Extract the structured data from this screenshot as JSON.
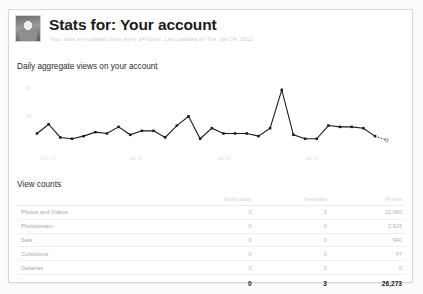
{
  "header": {
    "title": "Stats for: Your account",
    "subtitle": "Your stats are updated once every 24 hours. Last updated on Tue, Jan 24, 2012",
    "avatar_alt": "user-avatar"
  },
  "chart": {
    "title": "Daily aggregate views on your account",
    "ylabel": "",
    "xlabel": "",
    "y_ticks": [
      "40",
      "20"
    ],
    "x_ticks": [
      "Dec 26",
      "Jan 02",
      "Jan 09",
      "Jan 16"
    ]
  },
  "table": {
    "title": "View counts",
    "headers": [
      "",
      "So far today",
      "Yesterday",
      "All time"
    ],
    "rows": [
      {
        "label": "Photos and Videos",
        "today": "0",
        "yesterday": "3",
        "alltime": "22,660"
      },
      {
        "label": "Photostream",
        "today": "0",
        "yesterday": "0",
        "alltime": "2,626"
      },
      {
        "label": "Sets",
        "today": "0",
        "yesterday": "0",
        "alltime": "940"
      },
      {
        "label": "Collections",
        "today": "0",
        "yesterday": "0",
        "alltime": "47"
      },
      {
        "label": "Galleries",
        "today": "0",
        "yesterday": "0",
        "alltime": "0"
      }
    ],
    "total": {
      "label": "",
      "today": "0",
      "yesterday": "3",
      "alltime": "26,273"
    }
  },
  "colors": {
    "line": "#1a1a1a",
    "card_border": "#d8d8d8",
    "muted_text": "#b4b4b4",
    "title_text": "#1b1b1b"
  },
  "chart_data": {
    "type": "line",
    "title": "Daily aggregate views on your account",
    "xlabel": "",
    "ylabel": "",
    "ylim": [
      0,
      50
    ],
    "grid": false,
    "legend": false,
    "x": [
      "Dec 26",
      "Dec 27",
      "Dec 28",
      "Dec 29",
      "Dec 30",
      "Dec 31",
      "Jan 01",
      "Jan 02",
      "Jan 03",
      "Jan 04",
      "Jan 05",
      "Jan 06",
      "Jan 07",
      "Jan 08",
      "Jan 09",
      "Jan 10",
      "Jan 11",
      "Jan 12",
      "Jan 13",
      "Jan 14",
      "Jan 15",
      "Jan 16",
      "Jan 17",
      "Jan 18",
      "Jan 19",
      "Jan 20",
      "Jan 21",
      "Jan 22",
      "Jan 23",
      "Jan 24"
    ],
    "values": [
      11,
      18,
      8,
      7,
      9,
      12,
      11,
      16,
      10,
      13,
      13,
      8,
      17,
      24,
      7,
      15,
      11,
      11,
      11,
      9,
      15,
      44,
      10,
      7,
      7,
      17,
      16,
      16,
      15,
      9
    ],
    "projected_tail": {
      "from_index": 29,
      "value": 6
    },
    "series": [
      {
        "name": "Daily views",
        "values": [
          11,
          18,
          8,
          7,
          9,
          12,
          11,
          16,
          10,
          13,
          13,
          8,
          17,
          24,
          7,
          15,
          11,
          11,
          11,
          9,
          15,
          44,
          10,
          7,
          7,
          17,
          16,
          16,
          15,
          9
        ]
      }
    ]
  }
}
